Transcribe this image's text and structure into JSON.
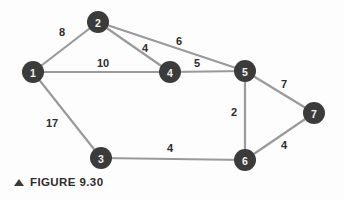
{
  "figure": {
    "caption": "FIGURE 9.30",
    "marker_icon": "triangle-up-icon",
    "canvas": {
      "width": 344,
      "height": 200
    },
    "colors": {
      "node_fill": "#3b3b3b",
      "node_text": "#f2f2f2",
      "edge_stroke": "#9a9a9a",
      "weight_text": "#2c2c2c",
      "background": "#fdfdfd"
    }
  },
  "chart_data": {
    "type": "diagram",
    "subtype": "weighted-undirected-graph",
    "title": "FIGURE 9.30",
    "node_radius": 11,
    "nodes": [
      {
        "id": "1",
        "label": "1",
        "x": 33,
        "y": 72
      },
      {
        "id": "2",
        "label": "2",
        "x": 98,
        "y": 22
      },
      {
        "id": "3",
        "label": "3",
        "x": 101,
        "y": 158
      },
      {
        "id": "4",
        "label": "4",
        "x": 170,
        "y": 72
      },
      {
        "id": "5",
        "label": "5",
        "x": 245,
        "y": 71
      },
      {
        "id": "6",
        "label": "6",
        "x": 245,
        "y": 160
      },
      {
        "id": "7",
        "label": "7",
        "x": 314,
        "y": 113
      }
    ],
    "edges": [
      {
        "source": "1",
        "target": "2",
        "weight": 8,
        "label": "8",
        "lx": 62,
        "ly": 32
      },
      {
        "source": "1",
        "target": "4",
        "weight": 10,
        "label": "10",
        "lx": 103,
        "ly": 63
      },
      {
        "source": "1",
        "target": "3",
        "weight": 17,
        "label": "17",
        "lx": 52,
        "ly": 123
      },
      {
        "source": "2",
        "target": "4",
        "weight": 4,
        "label": "4",
        "lx": 145,
        "ly": 48
      },
      {
        "source": "2",
        "target": "5",
        "weight": 6,
        "label": "6",
        "lx": 179,
        "ly": 41
      },
      {
        "source": "4",
        "target": "5",
        "weight": 5,
        "label": "5",
        "lx": 197,
        "ly": 63
      },
      {
        "source": "5",
        "target": "7",
        "weight": 7,
        "label": "7",
        "lx": 284,
        "ly": 84
      },
      {
        "source": "5",
        "target": "6",
        "weight": 2,
        "label": "2",
        "lx": 234,
        "ly": 112
      },
      {
        "source": "6",
        "target": "7",
        "weight": 4,
        "label": "4",
        "lx": 284,
        "ly": 145
      },
      {
        "source": "3",
        "target": "6",
        "weight": 4,
        "label": "4",
        "lx": 170,
        "ly": 148
      }
    ]
  }
}
